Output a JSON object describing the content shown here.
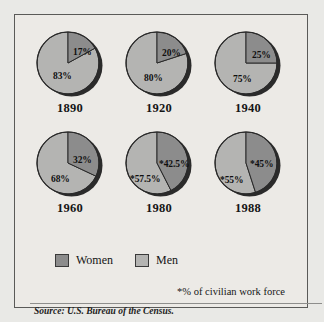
{
  "colors": {
    "page_background": "#e9e9e6",
    "panel_background": "#eceae6",
    "frame_border": "#5a5a58",
    "women": "#8c8c8c",
    "men": "#b4b4b2",
    "shadow": "#2b2b2b",
    "outline": "#2a2a2a",
    "text": "#141414"
  },
  "legend": {
    "items": [
      {
        "label": "Women",
        "color": "#8c8c8c"
      },
      {
        "label": "Men",
        "color": "#b4b4b2"
      }
    ]
  },
  "footnote": "*% of civilian work force",
  "source": "Source: U.S. Bureau of the Census.",
  "chart_data": {
    "type": "pie",
    "title": "",
    "subtitle": "",
    "xlabel": "",
    "ylabel": "",
    "legend_position": "bottom-left",
    "note": "*% of civilian work force",
    "source": "Source: U.S. Bureau of the Census.",
    "series_names": [
      "Women",
      "Men"
    ],
    "series_colors": [
      "#8c8c8c",
      "#b4b4b2"
    ],
    "charts": [
      {
        "year": "1890",
        "women_value": 17,
        "men_value": 83,
        "women_label": "17%",
        "men_label": "83%",
        "starred": false
      },
      {
        "year": "1920",
        "women_value": 20,
        "men_value": 80,
        "women_label": "20%",
        "men_label": "80%",
        "starred": false
      },
      {
        "year": "1940",
        "women_value": 25,
        "men_value": 75,
        "women_label": "25%",
        "men_label": "75%",
        "starred": false
      },
      {
        "year": "1960",
        "women_value": 32,
        "men_value": 68,
        "women_label": "32%",
        "men_label": "68%",
        "starred": false
      },
      {
        "year": "1980",
        "women_value": 42.5,
        "men_value": 57.5,
        "women_label": "*42.5%",
        "men_label": "*57.5%",
        "starred": true
      },
      {
        "year": "1988",
        "women_value": 45,
        "men_value": 55,
        "women_label": "*45%",
        "men_label": "*55%",
        "starred": true
      }
    ]
  }
}
